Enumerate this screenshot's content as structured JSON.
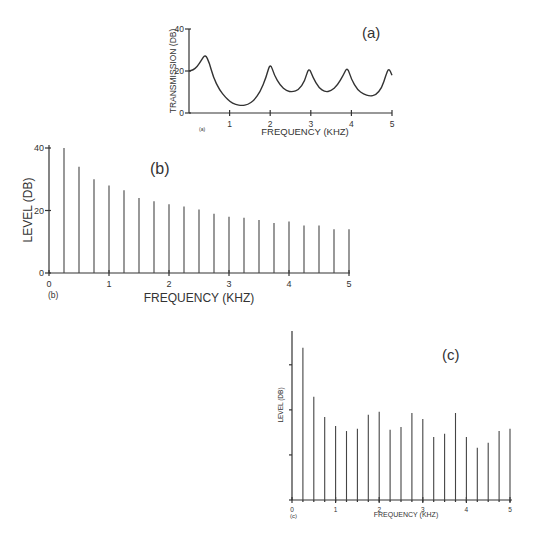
{
  "chart_data": [
    {
      "id": "a",
      "type": "line",
      "panel_label": "(a)",
      "corner_label": "(a)",
      "title": "",
      "xlabel": "FREQUENCY (KHZ)",
      "ylabel": "TRANSMISSION (DB)",
      "xlim": [
        0,
        5
      ],
      "ylim": [
        0,
        40
      ],
      "xticks": [
        1,
        2,
        3,
        4,
        5
      ],
      "yticks": [
        0,
        20,
        40
      ],
      "grid": false,
      "series": [
        {
          "name": "transmission",
          "x": [
            0,
            0.1,
            0.2,
            0.3,
            0.4,
            0.5,
            0.6,
            0.75,
            0.9,
            1.0,
            1.15,
            1.3,
            1.45,
            1.6,
            1.75,
            1.9,
            2.0,
            2.1,
            2.25,
            2.4,
            2.55,
            2.7,
            2.85,
            2.95,
            3.05,
            3.2,
            3.35,
            3.5,
            3.65,
            3.8,
            3.9,
            4.0,
            4.15,
            4.3,
            4.45,
            4.6,
            4.75,
            4.85,
            4.92,
            5.0
          ],
          "values": [
            20,
            20.5,
            22,
            25,
            28,
            24,
            17,
            11,
            7.5,
            5.5,
            4,
            3.5,
            4,
            6,
            10,
            17,
            24,
            18,
            13,
            10.5,
            10,
            11,
            15,
            22,
            17,
            12,
            10,
            10.5,
            13,
            18,
            22,
            16,
            11,
            9,
            8,
            8.5,
            12,
            18,
            21.5,
            18
          ]
        }
      ]
    },
    {
      "id": "b",
      "type": "bar",
      "panel_label": "(b)",
      "corner_label": "(b)",
      "title": "",
      "xlabel": "FREQUENCY (KHZ)",
      "ylabel": "LEVEL (DB)",
      "xlim": [
        0,
        5
      ],
      "ylim": [
        0,
        40
      ],
      "xticks": [
        0,
        1,
        2,
        3,
        4,
        5
      ],
      "yticks": [
        0,
        20,
        40
      ],
      "grid": false,
      "categories": [
        0.25,
        0.5,
        0.75,
        1.0,
        1.25,
        1.5,
        1.75,
        2.0,
        2.25,
        2.5,
        2.75,
        3.0,
        3.25,
        3.5,
        3.75,
        4.0,
        4.25,
        4.5,
        4.75,
        5.0
      ],
      "values": [
        40,
        34,
        30,
        28,
        26.5,
        24,
        23,
        22,
        21.3,
        20.3,
        19,
        18,
        17.7,
        17,
        16,
        16.5,
        15.2,
        15.2,
        14,
        14
      ]
    },
    {
      "id": "c",
      "type": "bar",
      "panel_label": "(c)",
      "corner_label": "(c)",
      "title": "",
      "xlabel": "FREQUENCY (KHZ)",
      "ylabel": "LEVEL (DB)",
      "xlim": [
        0,
        5
      ],
      "ylim": [
        0,
        37.5
      ],
      "xticks": [
        0,
        1,
        2,
        3,
        4,
        5
      ],
      "yticks_unlabeled": [
        0,
        10,
        20,
        30
      ],
      "grid": false,
      "categories": [
        0.25,
        0.5,
        0.75,
        1.0,
        1.25,
        1.5,
        1.75,
        2.0,
        2.25,
        2.5,
        2.75,
        3.0,
        3.25,
        3.5,
        3.75,
        4.0,
        4.25,
        4.5,
        4.75,
        5.0
      ],
      "values": [
        33.8,
        22.9,
        18.4,
        16.4,
        15.3,
        15.8,
        18.9,
        19.6,
        15.6,
        16.2,
        19.3,
        18,
        14,
        14.7,
        19.3,
        14,
        11.6,
        12.7,
        15.3,
        15.8
      ]
    }
  ]
}
